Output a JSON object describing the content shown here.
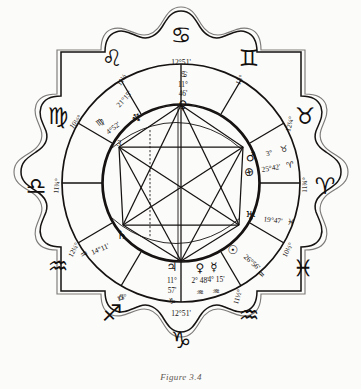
{
  "figure": {
    "caption": "Figure 3.4"
  },
  "outer_signs": [
    {
      "name": "cancer",
      "glyph": "♋",
      "degree": "12°51'",
      "position": "top"
    },
    {
      "name": "gemini",
      "glyph": "♊",
      "degree": "13°",
      "position": "upper-right"
    },
    {
      "name": "taurus",
      "glyph": "♉",
      "degree": "12¼°",
      "position": "right-upper"
    },
    {
      "name": "aries",
      "glyph": "♈",
      "degree": "11¾°",
      "position": "right"
    },
    {
      "name": "pisces",
      "glyph": "♓",
      "degree": "10½°",
      "position": "right-lower"
    },
    {
      "name": "aquarius-r",
      "glyph": "♒",
      "degree": "11½°",
      "position": "lower-right"
    },
    {
      "name": "capricorn",
      "glyph": "♑",
      "degree": "12°51'",
      "position": "bottom"
    },
    {
      "name": "sagittarius",
      "glyph": "♐",
      "degree": "13°",
      "position": "lower-left"
    },
    {
      "name": "aquarius-l",
      "glyph": "♒",
      "degree": "12¼°",
      "position": "left-lower"
    },
    {
      "name": "libra",
      "glyph": "♎",
      "degree": "11¾°",
      "position": "left"
    },
    {
      "name": "virgo",
      "glyph": "♍",
      "degree": "10½°",
      "position": "left-upper"
    },
    {
      "name": "leo",
      "glyph": "♌",
      "degree": "11½",
      "position": "upper-left"
    }
  ],
  "planets": [
    {
      "name": "venus-top",
      "glyph": "♀",
      "degrees": "11°",
      "minutes": "46'",
      "sign_glyph": "♋",
      "label": "11° 46'"
    },
    {
      "name": "neptune",
      "glyph": "♆",
      "text": "21°15'"
    },
    {
      "name": "node-virgo",
      "glyph": "♍",
      "text": "4°52'"
    },
    {
      "name": "mars",
      "glyph": "♂",
      "text": "3°",
      "sign_glyph": "♉"
    },
    {
      "name": "earth",
      "glyph": "⊕",
      "text": "25°42'",
      "sign_glyph": "♈"
    },
    {
      "name": "uranus",
      "glyph": "♅",
      "text": "19°47'",
      "sign_glyph": "♓"
    },
    {
      "name": "sun",
      "glyph": "☉",
      "text": "26°56'",
      "sign_glyph": "♒"
    },
    {
      "name": "venus",
      "glyph": "♀",
      "text": "2° 48'",
      "sign_glyph": "♒"
    },
    {
      "name": "mercury",
      "glyph": "☿",
      "text": "4° 15'",
      "sign_glyph": "♒"
    },
    {
      "name": "jupiter",
      "glyph": "♃",
      "degrees": "11°",
      "minutes": "57'",
      "sign_glyph": "♑"
    },
    {
      "name": "saturn",
      "glyph": "♄",
      "text": "14°11'",
      "sign_glyph": "♒"
    }
  ],
  "house_numbers": [
    {
      "name": "house-3",
      "value": "3"
    },
    {
      "name": "house-6",
      "value": "6"
    }
  ],
  "cusp_labels": {
    "top": "12°51'",
    "bottom": "12°51'"
  },
  "colors": {
    "ink": "#151211",
    "paper": "#fbfbf9",
    "caption": "#5d5751"
  }
}
